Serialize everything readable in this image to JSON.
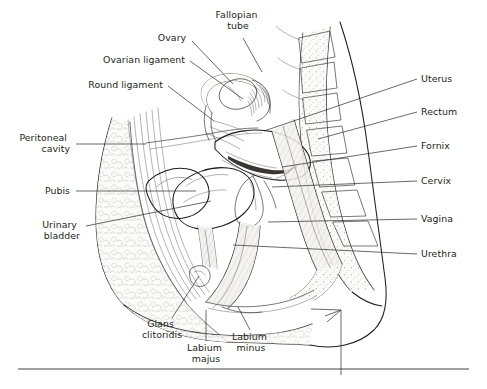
{
  "figure": {
    "background_color": "#ffffff",
    "ink_color": "#1d1d1d",
    "label_color": "#231f20"
  },
  "labels": [
    {
      "id": "fallopian-tube",
      "lines": [
        "Fallopian",
        "tube"
      ],
      "align": "middle",
      "x": 238,
      "y": 18,
      "leader": [
        [
          243,
          38
        ],
        [
          262,
          72
        ]
      ]
    },
    {
      "id": "ovary",
      "lines": [
        "Ovary"
      ],
      "align": "middle",
      "x": 172,
      "y": 41,
      "leader": [
        [
          192,
          41
        ],
        [
          233,
          84
        ]
      ]
    },
    {
      "id": "ovarian-ligament",
      "lines": [
        "Ovarian ligament"
      ],
      "align": "end",
      "x": 185,
      "y": 63,
      "leader": [
        [
          190,
          61
        ],
        [
          243,
          99
        ]
      ]
    },
    {
      "id": "round-ligament",
      "lines": [
        "Round ligament"
      ],
      "align": "end",
      "x": 163,
      "y": 88,
      "leader": [
        [
          168,
          86
        ],
        [
          214,
          121
        ]
      ]
    },
    {
      "id": "peritoneal-cavity",
      "lines": [
        "Peritoneal",
        "cavity"
      ],
      "align": "end",
      "x": 70,
      "y": 141,
      "leader": [
        [
          76,
          144
        ],
        [
          146,
          144
        ]
      ]
    },
    {
      "id": "pubis",
      "lines": [
        "Pubis"
      ],
      "align": "end",
      "x": 70,
      "y": 194,
      "leader": [
        [
          76,
          191
        ],
        [
          196,
          191
        ]
      ]
    },
    {
      "id": "urinary-bladder",
      "lines": [
        "Urinary",
        "bladder"
      ],
      "align": "end",
      "x": 80,
      "y": 228,
      "leader": [
        [
          86,
          226
        ],
        [
          211,
          201
        ]
      ]
    },
    {
      "id": "uterus",
      "lines": [
        "Uterus"
      ],
      "align": "start",
      "x": 421,
      "y": 82,
      "leader": [
        [
          417,
          79
        ],
        [
          264,
          131
        ]
      ]
    },
    {
      "id": "rectum",
      "lines": [
        "Rectum"
      ],
      "align": "start",
      "x": 421,
      "y": 115,
      "leader": [
        [
          417,
          112
        ],
        [
          318,
          139
        ]
      ]
    },
    {
      "id": "fornix",
      "lines": [
        "Fornix"
      ],
      "align": "start",
      "x": 421,
      "y": 149,
      "leader": [
        [
          417,
          146
        ],
        [
          282,
          167
        ]
      ]
    },
    {
      "id": "cervix",
      "lines": [
        "Cervix"
      ],
      "align": "start",
      "x": 421,
      "y": 184,
      "leader": [
        [
          417,
          181
        ],
        [
          272,
          187
        ]
      ]
    },
    {
      "id": "vagina",
      "lines": [
        "Vagina"
      ],
      "align": "start",
      "x": 421,
      "y": 222,
      "leader": [
        [
          417,
          219
        ],
        [
          268,
          222
        ]
      ]
    },
    {
      "id": "urethra",
      "lines": [
        "Urethra"
      ],
      "align": "start",
      "x": 421,
      "y": 257,
      "leader": [
        [
          417,
          254
        ],
        [
          233,
          245
        ]
      ]
    },
    {
      "id": "glans-clitoridis",
      "lines": [
        "Glans",
        "clitoridis"
      ],
      "align": "middle",
      "x": 162,
      "y": 327,
      "leader": [
        [
          172,
          318
        ],
        [
          199,
          276
        ]
      ]
    },
    {
      "id": "labium-majus",
      "lines": [
        "Labium",
        "majus"
      ],
      "align": "middle",
      "x": 206,
      "y": 351,
      "leader": [
        [
          206,
          341
        ],
        [
          206,
          310
        ]
      ]
    },
    {
      "id": "labium-minus",
      "lines": [
        "Labium",
        "minus"
      ],
      "align": "middle",
      "x": 251,
      "y": 340,
      "leader": [
        [
          250,
          330
        ],
        [
          238,
          307
        ]
      ]
    }
  ],
  "divider": {
    "present": true,
    "y": 369
  },
  "pointer_arrow": {
    "present": true,
    "label": "perineum-pointer"
  }
}
